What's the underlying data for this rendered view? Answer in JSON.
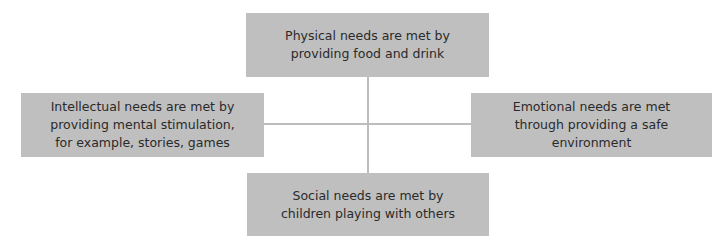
{
  "diagram": {
    "type": "hub-and-spoke",
    "colors": {
      "box_fill": "#bfbfbf",
      "connector": "#bdbdbd",
      "text": "#2a2a2a",
      "background": "#ffffff"
    },
    "nodes": {
      "top": {
        "text": "Physical needs are met by providing food and drink"
      },
      "left": {
        "text": "Intellectual needs are met by providing mental stimulation, for example, stories, games"
      },
      "right": {
        "text": "Emotional needs are met through providing a safe environment"
      },
      "bottom": {
        "text": "Social needs are met by children playing with others"
      }
    }
  }
}
